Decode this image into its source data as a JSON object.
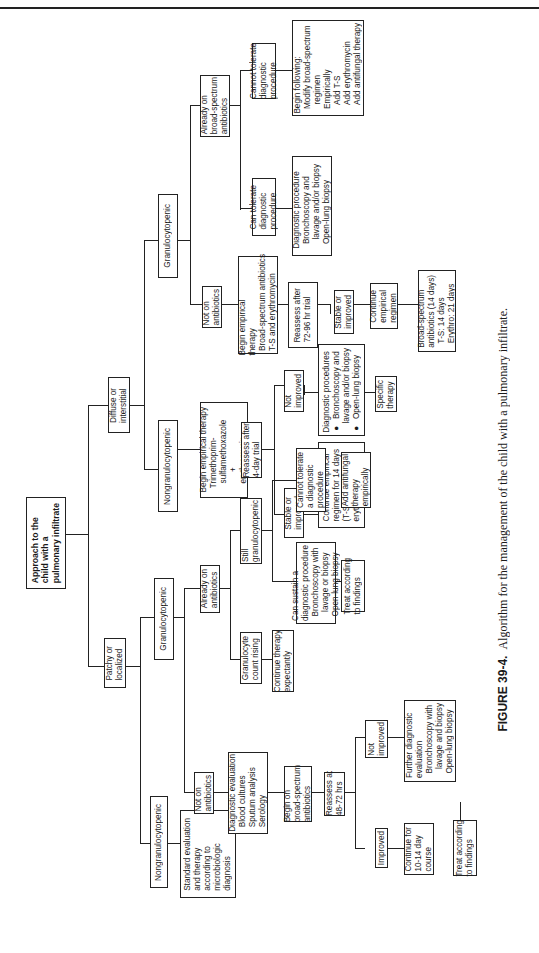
{
  "figure": {
    "label": "FIGURE 39-4.",
    "caption": "Algorithm for the management of the child with a pulmonary infiltrate."
  },
  "nodes": {
    "root": "Approach to the\nchild with a\npulmonary infiltrate",
    "diffuse": "Diffuse or\ninterstitial",
    "patchy": "Patchy or\nlocalized",
    "d_nongran": "Nongranulocytopenic",
    "d_gran": "Granulocytopenic",
    "d_ng_therapy": "Begin empirical therapy\n  Trimethoprim-\n    sulfamethoxazole\n         +\n    erythromycin",
    "d_ng_reassess": "Reassess after\n4-day trial",
    "d_ng_stable": "Stable or\nimproved",
    "d_ng_notimp": "Not\nimproved",
    "d_ng_continue": "Continue empirical\nregimen for 14 days\n(T-S) and 21 days\nerythromycin)",
    "d_ng_diag": "Diagnostic procedures\n●  Bronchoscopy and\n    lavage and/or biopsy\n●  Open-lung biopsy",
    "d_ng_specific": "Specific\ntherapy",
    "d_g_noton": "Not on\nantibiotics",
    "d_g_already": "Already on\nbroad-spectrum\nantibiotics",
    "d_g_begin": "Begin empirical\ntherapy\n  Broad-spectrum antibiotics\n  T-S and erythromycin",
    "d_g_reassess": "Reassess after\n72-96 hr trial",
    "d_g_stable": "Stable or\nimproved",
    "d_g_continue": "Continue\nempirical\nregimen",
    "d_g_final": "Broad-spectrum\nantibiotics (14 days)\n  T-S: 14 days\n  Erythro: 21 days",
    "d_g_can": "Can tolerate\ndiagnostic\nprocedure",
    "d_g_cannot": "Cannot tolerate\ndiagnostic\nprocedure",
    "d_g_diag": "Diagnostic procedure\n  Bronchoscopy and\n    lavage and/or biopsy\n  Open-lung biopsy",
    "d_g_begin_following": "Begin following:\n  Modify broad-spectrum\n    regimen\n  Empirically\n    Add T-S\n    Add erythromycin\n    Add antifungal therapy",
    "p_nongran": "Nongranulocytopenic",
    "p_std": "Standard evaluation\nand therapy\naccording to\nmicrobiologic\ndiagnosis",
    "p_gran": "Granulocytopenic",
    "p_noton": "Not on\nantibiotics",
    "p_diag_eval": "Diagnostic evaluation\n  Blood cultures\n  Sputum analysis\n  Serology",
    "p_begin": "Begin on\nbroad-spectrum\nantibiotics",
    "p_reassess": "Reassess at\n48-72 hrs",
    "p_improved": "Improved",
    "p_notimp": "Not\nimproved",
    "p_continue": "Continue for\n10-14 day\ncourse",
    "p_further": "Further diagnostic\nevaluation\n  Bronchoscopy with\n    lavage and biopsy\n  Open-lung biopsy",
    "p_treat2": "Treat according\nto findings",
    "p_already": "Already on\nantibiotics",
    "p_rising": "Granulocyte\ncount rising",
    "p_expect": "Continue therapy\nexpectantly",
    "p_still": "Still\ngranulocytopenic",
    "p_can": "Can sustain a\ndiagnostic procedure\n  Bronchoscopy with\n    lavage or biopsy\n  Open-lung biopsy",
    "p_cannot": "Cannot tolerate\na diagnostic\nprocedure",
    "p_treat1": "Treat according\nto findings",
    "p_antifungal": "Add antifungal\ntherapy\nempirically"
  }
}
